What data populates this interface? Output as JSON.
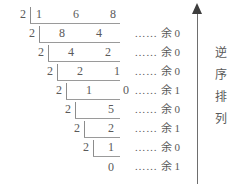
{
  "diagram": {
    "type": "successive-division-binary-conversion",
    "divisor": "2",
    "final_quotient": "0",
    "remainder_prefix": "……",
    "remainder_word": "余",
    "side_note_chars": [
      "逆",
      "序",
      "排",
      "列"
    ],
    "arrow_direction": "up",
    "rows": [
      {
        "divisor": "2",
        "dividend": "1 6 8",
        "dots": "……",
        "yu": "余",
        "remainder": "0"
      },
      {
        "divisor": "2",
        "dividend": "8 4",
        "dots": "……",
        "yu": "余",
        "remainder": "0"
      },
      {
        "divisor": "2",
        "dividend": "4 2",
        "dots": "……",
        "yu": "余",
        "remainder": "0"
      },
      {
        "divisor": "2",
        "dividend": "2 1",
        "dots": "……",
        "yu": "余",
        "remainder": "1"
      },
      {
        "divisor": "2",
        "dividend": "1 0",
        "dots": "……",
        "yu": "余",
        "remainder": "0"
      },
      {
        "divisor": "2",
        "dividend": "5",
        "dots": "……",
        "yu": "余",
        "remainder": "1"
      },
      {
        "divisor": "2",
        "dividend": "2",
        "dots": "……",
        "yu": "余",
        "remainder": "0"
      },
      {
        "divisor": "2",
        "dividend": "1",
        "dots": "……",
        "yu": "余",
        "remainder": "1"
      }
    ]
  },
  "colors": {
    "ink": "#5a5a5a",
    "rule": "#9a9a9a",
    "arrow": "#3d3d3d",
    "background": "#ffffff"
  }
}
